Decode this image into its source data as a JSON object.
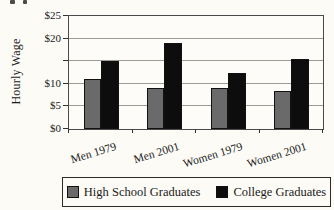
{
  "figure": {
    "y_axis_title": "Hourly Wage"
  },
  "chart_data": {
    "type": "bar",
    "title": "",
    "categories": [
      "Men 1979",
      "Men 2001",
      "Women 1979",
      "Women 2001"
    ],
    "series": [
      {
        "name": "High School Graduates",
        "color": "#6a6a6a",
        "values": [
          11,
          9,
          9,
          8.5
        ]
      },
      {
        "name": "College Graduates",
        "color": "#0d0d0d",
        "values": [
          15,
          19,
          12.5,
          15.5
        ]
      }
    ],
    "xlabel": "",
    "ylabel": "Hourly Wage",
    "ylim": [
      0,
      25
    ],
    "y_gridline_step": 5,
    "grid": true,
    "y_tick_labels": [
      {
        "label": "$25",
        "value": 25
      },
      {
        "label": "$20",
        "value": 20
      },
      {
        "label": "$10",
        "value": 10
      },
      {
        "label": "$5",
        "value": 5
      },
      {
        "label": "$0",
        "value": 0
      }
    ],
    "legend_position": "bottom"
  }
}
